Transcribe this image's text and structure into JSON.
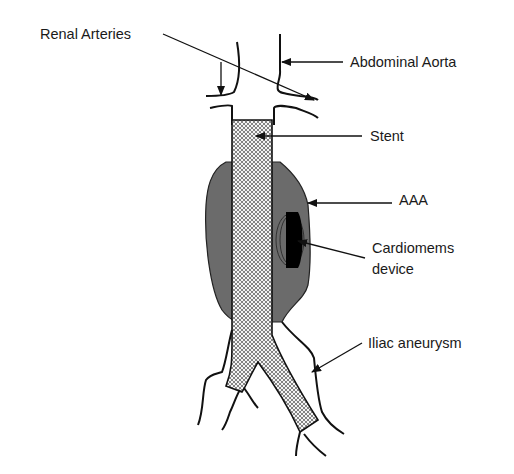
{
  "labels": {
    "renal_arteries": "Renal Arteries",
    "abdominal_aorta": "Abdominal Aorta",
    "stent": "Stent",
    "aaa": "AAA",
    "cardiomems_line1": "Cardiomems",
    "cardiomems_line2": "device",
    "iliac_aneurysm": "Iliac aneurysm"
  },
  "colors": {
    "aneurysm_fill": "#6b6b6b",
    "outline": "#111111",
    "stent_mesh": "#8a8a8a",
    "device": "#000000"
  }
}
